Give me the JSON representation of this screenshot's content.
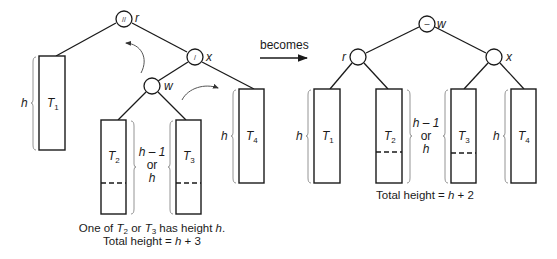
{
  "diagram": {
    "transition_label": "becomes",
    "before": {
      "nodes": {
        "r": {
          "name": "r",
          "balance": "//"
        },
        "x": {
          "name": "x",
          "balance": "/"
        },
        "w": {
          "name": "w",
          "balance": ""
        }
      },
      "subtrees": {
        "T1": {
          "label": "T",
          "sub": "1",
          "height_label": "h"
        },
        "T2": {
          "label": "T",
          "sub": "2"
        },
        "T3": {
          "label": "T",
          "sub": "3"
        },
        "T4": {
          "label": "T",
          "sub": "4",
          "height_label": "h"
        }
      },
      "middle_height": {
        "line1": "h – 1",
        "line2": "or",
        "line3": "h"
      },
      "caption": {
        "line1_pre": "One of ",
        "line1_t2": "T",
        "line1_t2_sub": "2",
        "line1_mid": " or ",
        "line1_t3": "T",
        "line1_t3_sub": "3",
        "line1_post": " has height ",
        "line1_h": "h",
        "line1_end": ".",
        "line2_pre": "Total height = ",
        "line2_h": "h",
        "line2_post": " + 3"
      }
    },
    "after": {
      "nodes": {
        "w": {
          "name": "w",
          "balance": "–"
        },
        "r": {
          "name": "r",
          "balance": ""
        },
        "x": {
          "name": "x",
          "balance": ""
        }
      },
      "subtrees": {
        "T1": {
          "label": "T",
          "sub": "1",
          "height_label": "h"
        },
        "T2": {
          "label": "T",
          "sub": "2"
        },
        "T3": {
          "label": "T",
          "sub": "3"
        },
        "T4": {
          "label": "T",
          "sub": "4",
          "height_label": "h"
        }
      },
      "middle_height": {
        "line1": "h – 1",
        "line2": "or",
        "line3": "h"
      },
      "caption": {
        "line1_pre": "Total height = ",
        "line1_h": "h",
        "line1_post": " + 2"
      }
    }
  }
}
